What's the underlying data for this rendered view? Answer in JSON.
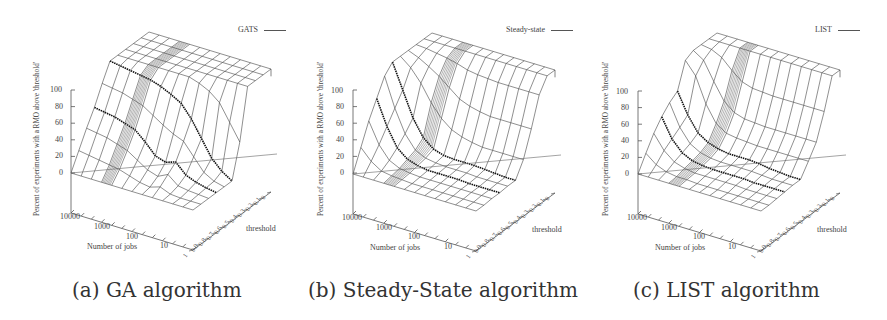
{
  "figure": {
    "panels": [
      {
        "id": "a",
        "caption": "(a) GA algorithm",
        "legend": "GATS"
      },
      {
        "id": "b",
        "caption": "(b) Steady-State algorithm",
        "legend": "Steady-state"
      },
      {
        "id": "c",
        "caption": "(c) LIST algorithm",
        "legend": "LIST"
      }
    ]
  },
  "axes": {
    "zlabel": "Percent of experiments with a RMO above 'threshold'",
    "xlabel": "Number of jobs",
    "ylabel": "threshold",
    "z_ticks": [
      "100",
      "80",
      "60",
      "40",
      "20",
      "0"
    ],
    "x_ticks": [
      "10000",
      "1000",
      "100",
      "10",
      "1"
    ],
    "y_ticks": [
      "0",
      "0.1",
      "0.2",
      "0.3",
      "0.4",
      "0.5",
      "0.6",
      "0.7",
      "0.8",
      "0.9",
      "1"
    ]
  },
  "chart_data": [
    {
      "type": "surface3d",
      "title": "(a) GA algorithm",
      "legend": "GATS",
      "xlabel": "Number of jobs",
      "ylabel": "threshold",
      "zlabel": "Percent of experiments with a RMO above 'threshold'",
      "x_scale": "log",
      "x_range": [
        1,
        10000
      ],
      "y_range": [
        0,
        1
      ],
      "z_range": [
        0,
        100
      ],
      "jobs": [
        10000,
        5000,
        2000,
        1000,
        500,
        200,
        100,
        50,
        20,
        10,
        5,
        2,
        1
      ],
      "thresholds": [
        0,
        0.1,
        0.2,
        0.3,
        0.4,
        0.5,
        0.6,
        0.7,
        0.8,
        0.9,
        1
      ],
      "highlighted_rows": [
        {
          "threshold": 0.5,
          "values": [
            100,
            98,
            96,
            94,
            92,
            88,
            82,
            75,
            60,
            40,
            20,
            8,
            0
          ]
        },
        {
          "threshold": 0.7,
          "values": [
            58,
            56,
            54,
            50,
            46,
            35,
            22,
            18,
            22,
            10,
            5,
            2,
            0
          ]
        }
      ],
      "z": [
        [
          100,
          100,
          100,
          100,
          100,
          100,
          100,
          100,
          100,
          100,
          100,
          100,
          100
        ],
        [
          100,
          100,
          100,
          100,
          100,
          100,
          100,
          100,
          100,
          100,
          100,
          100,
          100
        ],
        [
          100,
          100,
          100,
          100,
          100,
          100,
          100,
          100,
          100,
          100,
          100,
          100,
          100
        ],
        [
          100,
          100,
          100,
          100,
          100,
          100,
          100,
          100,
          100,
          100,
          100,
          100,
          100
        ],
        [
          100,
          100,
          100,
          100,
          100,
          100,
          100,
          100,
          96,
          90,
          80,
          60,
          40
        ],
        [
          100,
          98,
          96,
          94,
          92,
          88,
          82,
          75,
          60,
          40,
          20,
          8,
          0
        ],
        [
          80,
          78,
          76,
          72,
          68,
          60,
          52,
          45,
          40,
          25,
          10,
          3,
          0
        ],
        [
          58,
          56,
          54,
          50,
          46,
          35,
          22,
          18,
          22,
          10,
          5,
          2,
          0
        ],
        [
          40,
          38,
          36,
          32,
          28,
          20,
          12,
          8,
          14,
          4,
          2,
          1,
          0
        ],
        [
          20,
          18,
          16,
          14,
          12,
          8,
          4,
          2,
          6,
          1,
          0,
          0,
          0
        ],
        [
          0,
          0,
          0,
          0,
          0,
          0,
          0,
          0,
          0,
          0,
          0,
          0,
          0
        ]
      ]
    },
    {
      "type": "surface3d",
      "title": "(b) Steady-State algorithm",
      "legend": "Steady-state",
      "xlabel": "Number of jobs",
      "ylabel": "threshold",
      "zlabel": "Percent of experiments with a RMO above 'threshold'",
      "x_scale": "log",
      "x_range": [
        1,
        10000
      ],
      "y_range": [
        0,
        1
      ],
      "z_range": [
        0,
        100
      ],
      "jobs": [
        10000,
        5000,
        2000,
        1000,
        500,
        200,
        100,
        50,
        20,
        10,
        5,
        2,
        1
      ],
      "thresholds": [
        0,
        0.1,
        0.2,
        0.3,
        0.4,
        0.5,
        0.6,
        0.7,
        0.8,
        0.9,
        1
      ],
      "highlighted_rows": [
        {
          "threshold": 0.5,
          "values": [
            100,
            70,
            40,
            20,
            10,
            6,
            5,
            5,
            5,
            4,
            3,
            2,
            2
          ]
        },
        {
          "threshold": 0.7,
          "values": [
            70,
            40,
            18,
            8,
            4,
            2,
            2,
            2,
            2,
            1,
            1,
            1,
            1
          ]
        }
      ],
      "z": [
        [
          100,
          100,
          100,
          100,
          100,
          100,
          100,
          100,
          100,
          100,
          100,
          100,
          100
        ],
        [
          100,
          100,
          100,
          100,
          100,
          100,
          100,
          100,
          100,
          100,
          100,
          100,
          100
        ],
        [
          100,
          99,
          97,
          95,
          92,
          88,
          86,
          85,
          84,
          84,
          84,
          84,
          84
        ],
        [
          100,
          95,
          88,
          80,
          70,
          60,
          55,
          52,
          50,
          50,
          50,
          50,
          50
        ],
        [
          100,
          90,
          75,
          55,
          40,
          30,
          25,
          22,
          20,
          20,
          20,
          20,
          20
        ],
        [
          100,
          70,
          40,
          20,
          10,
          6,
          5,
          5,
          5,
          4,
          3,
          2,
          2
        ],
        [
          90,
          55,
          28,
          12,
          6,
          4,
          3,
          3,
          3,
          2,
          2,
          2,
          2
        ],
        [
          70,
          40,
          18,
          8,
          4,
          2,
          2,
          2,
          2,
          1,
          1,
          1,
          1
        ],
        [
          50,
          25,
          10,
          4,
          2,
          1,
          1,
          1,
          1,
          1,
          1,
          1,
          1
        ],
        [
          25,
          12,
          4,
          2,
          1,
          0,
          0,
          0,
          0,
          0,
          0,
          0,
          0
        ],
        [
          0,
          0,
          0,
          0,
          0,
          0,
          0,
          0,
          0,
          0,
          0,
          0,
          0
        ]
      ]
    },
    {
      "type": "surface3d",
      "title": "(c) LIST algorithm",
      "legend": "LIST",
      "xlabel": "Number of jobs",
      "ylabel": "threshold",
      "zlabel": "Percent of experiments with a RMO above 'threshold'",
      "x_scale": "log",
      "x_range": [
        1,
        10000
      ],
      "y_range": [
        0,
        1
      ],
      "z_range": [
        0,
        100
      ],
      "jobs": [
        10000,
        5000,
        2000,
        1000,
        500,
        200,
        100,
        50,
        20,
        10,
        5,
        2,
        1
      ],
      "thresholds": [
        0,
        0.1,
        0.2,
        0.3,
        0.4,
        0.5,
        0.6,
        0.7,
        0.8,
        0.9,
        1
      ],
      "highlighted_rows": [
        {
          "threshold": 0.5,
          "values": [
            65,
            40,
            22,
            14,
            10,
            8,
            8,
            8,
            7,
            5,
            4,
            3,
            3
          ]
        },
        {
          "threshold": 0.7,
          "values": [
            48,
            25,
            12,
            6,
            4,
            3,
            3,
            3,
            3,
            2,
            2,
            2,
            2
          ]
        }
      ],
      "z": [
        [
          100,
          100,
          100,
          100,
          100,
          100,
          100,
          100,
          100,
          100,
          100,
          100,
          100
        ],
        [
          100,
          100,
          100,
          100,
          100,
          100,
          100,
          100,
          100,
          100,
          100,
          100,
          100
        ],
        [
          100,
          98,
          92,
          80,
          70,
          66,
          65,
          64,
          64,
          64,
          64,
          64,
          64
        ],
        [
          100,
          92,
          70,
          50,
          40,
          36,
          35,
          34,
          34,
          34,
          34,
          34,
          34
        ],
        [
          95,
          80,
          50,
          30,
          22,
          20,
          19,
          18,
          18,
          18,
          18,
          18,
          18
        ],
        [
          65,
          40,
          22,
          14,
          10,
          8,
          8,
          8,
          7,
          5,
          4,
          3,
          3
        ],
        [
          58,
          32,
          16,
          9,
          6,
          5,
          5,
          5,
          5,
          4,
          3,
          3,
          3
        ],
        [
          48,
          25,
          12,
          6,
          4,
          3,
          3,
          3,
          3,
          2,
          2,
          2,
          2
        ],
        [
          35,
          18,
          8,
          4,
          2,
          2,
          2,
          2,
          2,
          1,
          1,
          1,
          1
        ],
        [
          18,
          8,
          3,
          1,
          1,
          0,
          0,
          0,
          0,
          0,
          0,
          0,
          0
        ],
        [
          0,
          0,
          0,
          0,
          0,
          0,
          0,
          0,
          0,
          0,
          0,
          0,
          0
        ]
      ]
    }
  ]
}
